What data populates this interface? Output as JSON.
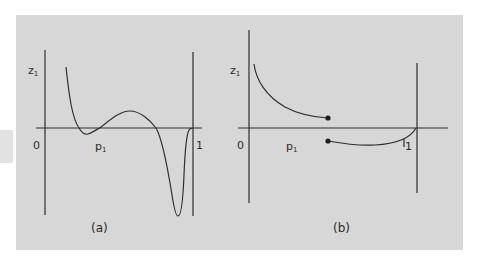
{
  "figure": {
    "background_color": "#d7d7d7",
    "line_color": "#2e2e2e",
    "panels": [
      {
        "id": "a",
        "caption": "(a)",
        "y_axis_label": "z",
        "y_axis_subscript": "1",
        "x_axis_label": "p",
        "x_axis_subscript": "1",
        "origin_label": "0",
        "right_bound_label": "1",
        "description": "Continuous curve z1(p1): starts high near p1≈0.1, dips slightly below zero, rises to a local maximum, crosses down, sharp deep minimum just before p1=1, returns to 0 at p1=1"
      },
      {
        "id": "b",
        "caption": "(b)",
        "y_axis_label": "z",
        "y_axis_subscript": "1",
        "x_axis_label": "p",
        "x_axis_subscript": "1",
        "origin_label": "0",
        "right_bound_label": "1",
        "description": "Discontinuous curve z1(p1): positive decreasing branch ending at a filled dot at mid p1, jump to a negative branch starting at a filled dot, rising to 0 at p1=1"
      }
    ]
  }
}
